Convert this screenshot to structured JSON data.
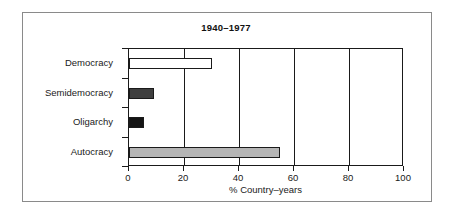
{
  "chart_data": {
    "type": "bar",
    "orientation": "horizontal",
    "title": "1940–1977",
    "xlabel": "% Country–years",
    "ylabel": "",
    "categories": [
      "Democracy",
      "Semidemocracy",
      "Oligarchy",
      "Autocracy"
    ],
    "values": [
      30,
      9,
      5.5,
      55
    ],
    "xlim": [
      0,
      100
    ],
    "xticks": [
      0,
      20,
      40,
      60,
      80,
      100
    ],
    "xtick_labels": [
      "0",
      "20",
      "40",
      "60",
      "80",
      "100"
    ],
    "grid": "vertical",
    "legend": "none",
    "bar_colors": [
      "#ffffff",
      "#3f3f3f",
      "#141414",
      "#b5b5b5"
    ],
    "bar_edge_color": "#1a1a1a",
    "series": [
      {
        "name": "% Country-years",
        "points": [
          {
            "category": "Democracy",
            "value": 30,
            "fill": "#ffffff"
          },
          {
            "category": "Semidemocracy",
            "value": 9,
            "fill": "#3f3f3f"
          },
          {
            "category": "Oligarchy",
            "value": 5.5,
            "fill": "#141414"
          },
          {
            "category": "Autocracy",
            "value": 55,
            "fill": "#b5b5b5"
          }
        ]
      }
    ]
  },
  "frame": {
    "border_color": "#8a8a8a"
  }
}
